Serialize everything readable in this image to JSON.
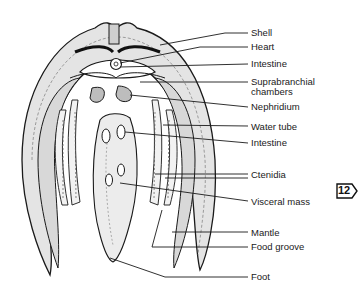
{
  "figure": {
    "badge": "12",
    "colors": {
      "ink": "#1a1a1a",
      "shade": "#c8c8c8",
      "light": "#e6e6e6",
      "background": "#ffffff"
    }
  },
  "labels": [
    {
      "id": "shell",
      "text": "Shell",
      "x": 251,
      "y": 28,
      "line": [
        [
          160,
          45
        ],
        [
          225,
          33
        ],
        [
          248,
          33
        ]
      ]
    },
    {
      "id": "heart",
      "text": "Heart",
      "x": 251,
      "y": 42,
      "line": [
        [
          120,
          63
        ],
        [
          200,
          47
        ],
        [
          248,
          47
        ]
      ]
    },
    {
      "id": "intestine-top",
      "text": "Intestine",
      "x": 251,
      "y": 59,
      "line": [
        [
          120,
          67
        ],
        [
          248,
          64
        ]
      ]
    },
    {
      "id": "suprabranchial-chambers",
      "text": "Suprabranchial\nchambers",
      "x": 251,
      "y": 77,
      "line": [
        [
          140,
          82
        ],
        [
          248,
          82
        ]
      ]
    },
    {
      "id": "nephridium",
      "text": "Nephridium",
      "x": 251,
      "y": 102,
      "line": [
        [
          130,
          95
        ],
        [
          248,
          107
        ]
      ]
    },
    {
      "id": "water-tube",
      "text": "Water tube",
      "x": 251,
      "y": 122,
      "line": [
        [
          163,
          125
        ],
        [
          248,
          126
        ]
      ]
    },
    {
      "id": "intestine-bottom",
      "text": "Intestine",
      "x": 251,
      "y": 138,
      "line": [
        [
          125,
          132
        ],
        [
          248,
          143
        ]
      ]
    },
    {
      "id": "ctenidia",
      "text": "Ctenidia",
      "x": 251,
      "y": 170,
      "line": [
        [
          155,
          174
        ],
        [
          248,
          174
        ]
      ],
      "line2": [
        [
          165,
          178
        ],
        [
          248,
          178
        ]
      ]
    },
    {
      "id": "visceral-mass",
      "text": "Visceral mass",
      "x": 251,
      "y": 197,
      "line": [
        [
          120,
          183
        ],
        [
          248,
          201
        ]
      ]
    },
    {
      "id": "mantle",
      "text": "Mantle",
      "x": 251,
      "y": 228,
      "line": [
        [
          172,
          232
        ],
        [
          248,
          232
        ]
      ]
    },
    {
      "id": "food-groove",
      "text": "Food groove",
      "x": 251,
      "y": 242,
      "line": [
        [
          162,
          210
        ],
        [
          152,
          247
        ],
        [
          248,
          247
        ]
      ]
    },
    {
      "id": "foot",
      "text": "Foot",
      "x": 251,
      "y": 272,
      "line": [
        [
          110,
          258
        ],
        [
          165,
          277
        ],
        [
          248,
          277
        ]
      ]
    }
  ]
}
